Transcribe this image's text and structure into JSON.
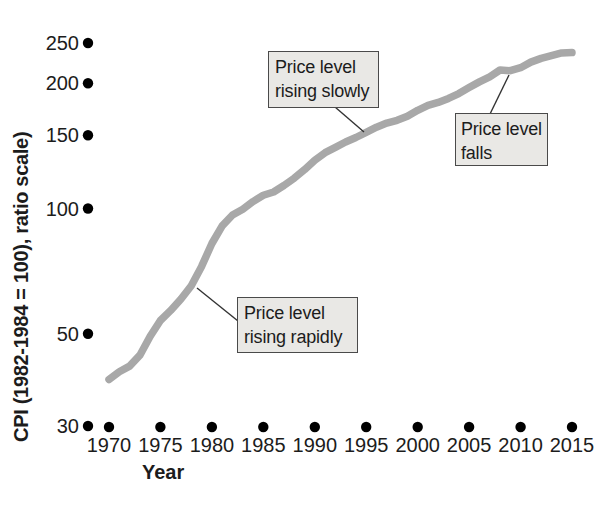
{
  "figure": {
    "background": "#ffffff",
    "curve_color": "#a8a8a8",
    "dot_color": "#000000",
    "text_color": "#1c1c1c",
    "annotation_bg": "#e9e8e5",
    "annotation_border": "#4a4a4a",
    "leader_color": "#333333"
  },
  "chart_data": {
    "type": "line",
    "title": "",
    "xlabel": "Year",
    "ylabel": "CPI (1982-1984 = 100), ratio scale)",
    "y_scale": "log",
    "grid": false,
    "legend": false,
    "xlim": [
      1970,
      2015
    ],
    "ylim": [
      30,
      260
    ],
    "x_ticks": [
      1970,
      1975,
      1980,
      1985,
      1990,
      1995,
      2000,
      2005,
      2010,
      2015
    ],
    "y_ticks": [
      30,
      50,
      100,
      150,
      200,
      250
    ],
    "series": [
      {
        "name": "CPI",
        "x": [
          1970,
          1971,
          1972,
          1973,
          1974,
          1975,
          1976,
          1977,
          1978,
          1979,
          1980,
          1981,
          1982,
          1983,
          1984,
          1985,
          1986,
          1987,
          1988,
          1989,
          1990,
          1991,
          1992,
          1993,
          1994,
          1995,
          1996,
          1997,
          1998,
          1999,
          2000,
          2001,
          2002,
          2003,
          2004,
          2005,
          2006,
          2007,
          2008,
          2009,
          2010,
          2011,
          2012,
          2013,
          2014,
          2015
        ],
        "values": [
          38.8,
          40.5,
          41.8,
          44.4,
          49.3,
          53.8,
          56.9,
          60.6,
          65.2,
          72.6,
          82.4,
          90.9,
          96.5,
          99.6,
          103.9,
          107.6,
          109.6,
          113.6,
          118.3,
          124.0,
          130.7,
          136.2,
          140.3,
          144.5,
          148.2,
          152.4,
          156.9,
          160.5,
          163.0,
          166.6,
          172.2,
          177.1,
          179.9,
          184.0,
          188.9,
          195.3,
          201.6,
          207.3,
          215.3,
          214.5,
          218.1,
          224.9,
          229.6,
          233.0,
          236.7,
          237.0
        ]
      }
    ],
    "annotations": [
      {
        "lines": [
          "Price level",
          "rising slowly"
        ],
        "points_to": {
          "year": 1995,
          "value": 152.4
        }
      },
      {
        "lines": [
          "Price level",
          "rising rapidly"
        ],
        "points_to": {
          "year": 1978,
          "value": 65.2
        }
      },
      {
        "lines": [
          "Price level",
          "falls"
        ],
        "points_to": {
          "year": 2009,
          "value": 214.5
        }
      }
    ]
  }
}
